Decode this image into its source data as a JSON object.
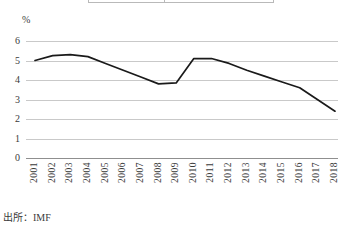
{
  "figure": {
    "unit_label": "%",
    "source_note": "出所：IMF",
    "line_color": "#1a1a1a",
    "grid_color": "#c9c9c9",
    "axis_color": "#8f8f8f"
  },
  "chart_data": {
    "type": "line",
    "title": "",
    "subtitle": "",
    "xlabel": "",
    "ylabel": "%",
    "ylim": [
      0,
      6
    ],
    "ytick_labels": [
      "6",
      "5",
      "4",
      "3",
      "2",
      "1",
      "0"
    ],
    "ytick_values": [
      6,
      5,
      4,
      3,
      2,
      1,
      0
    ],
    "grid": true,
    "legend": "none",
    "categories": [
      "2001",
      "2002",
      "2003",
      "2004",
      "2005",
      "2006",
      "2007",
      "2008",
      "2009",
      "2010",
      "2011",
      "2012",
      "2013",
      "2014",
      "2015",
      "2016",
      "2017",
      "2018"
    ],
    "values": [
      5.0,
      5.25,
      5.3,
      5.2,
      4.85,
      4.5,
      4.15,
      3.8,
      3.85,
      5.1,
      5.1,
      4.85,
      4.5,
      4.2,
      3.9,
      3.6,
      3.0,
      2.4
    ]
  }
}
